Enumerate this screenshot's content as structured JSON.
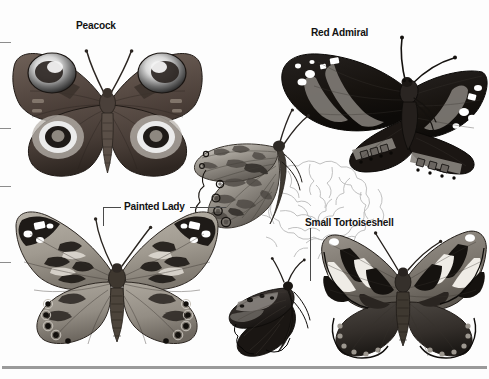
{
  "plate": {
    "title": "Butterfly identification plate",
    "background_color": "#fdfdfd",
    "width": 489,
    "height": 379,
    "style": "grayscale halftone field-guide illustration"
  },
  "labels": [
    {
      "id": "peacock",
      "text": "Peacock",
      "x": 76,
      "y": 19,
      "color": "#121212"
    },
    {
      "id": "red-admiral",
      "text": "Red Admiral",
      "x": 311,
      "y": 26,
      "color": "#121212"
    },
    {
      "id": "painted-lady",
      "text": "Painted Lady",
      "x": 124,
      "y": 200,
      "color": "#121212"
    },
    {
      "id": "small-tortoiseshell",
      "text": "Small Tortoiseshell",
      "x": 305,
      "y": 216,
      "color": "#121212"
    }
  ],
  "leader_lines": [
    {
      "id": "painted-lady-left-horizontal",
      "x": 103,
      "y": 207,
      "w": 18,
      "h": 1
    },
    {
      "id": "painted-lady-left-vertical",
      "x": 103,
      "y": 207,
      "w": 1,
      "h": 19
    },
    {
      "id": "painted-lady-right-horizontal",
      "x": 190,
      "y": 207,
      "w": 36,
      "h": 1
    },
    {
      "id": "small-tortoiseshell-vertical",
      "x": 310,
      "y": 228,
      "w": 1,
      "h": 53
    }
  ],
  "edge_ticks": [
    {
      "id": "tick-top",
      "y": 42,
      "width": 11
    },
    {
      "id": "tick-middle",
      "y": 128,
      "width": 11
    },
    {
      "id": "tick-lower",
      "y": 186,
      "width": 11
    },
    {
      "id": "tick-bottom",
      "y": 262,
      "width": 11
    }
  ],
  "base_rule": {
    "id": "bottom-rule",
    "x": 2,
    "y": 366,
    "w": 485,
    "h": 3,
    "color": "#9a9a9a"
  },
  "specimens": [
    {
      "id": "peacock",
      "common_name": "Peacock",
      "view": "dorsal wings spread",
      "x": 8,
      "y": 33,
      "w": 196,
      "h": 145,
      "features": "four large eyespots, dark red-brown ground colour"
    },
    {
      "id": "red-admiral",
      "common_name": "Red Admiral",
      "view": "dorsal wings spread, angled",
      "x": 258,
      "y": 38,
      "w": 231,
      "h": 145,
      "features": "near-black wings, broad pale bands, white apical spots"
    },
    {
      "id": "peacock-underside",
      "common_name": "Peacock",
      "view": "ventral / underside side view",
      "x": 186,
      "y": 112,
      "w": 122,
      "h": 122,
      "features": "mottled cryptic pattern with ringed ocelli along margin"
    },
    {
      "id": "painted-lady",
      "common_name": "Painted Lady",
      "view": "dorsal wings spread",
      "x": 6,
      "y": 199,
      "w": 220,
      "h": 150,
      "features": "orange ground, black apex with white spots, row of hindwing ocelli"
    },
    {
      "id": "small-tortoiseshell-underside",
      "common_name": "Small Tortoiseshell",
      "view": "ventral side view at rest",
      "x": 228,
      "y": 262,
      "w": 96,
      "h": 100,
      "features": "dark bark-like underside, pale subapical band"
    },
    {
      "id": "small-tortoiseshell",
      "common_name": "Small Tortoiseshell",
      "view": "dorsal wings spread",
      "x": 322,
      "y": 222,
      "w": 167,
      "h": 140,
      "features": "banded forewings with black and cream blocks, blue marginal lunules"
    },
    {
      "id": "background-flower-cluster",
      "common_name": "Flower cluster outline",
      "view": "line drawing background",
      "x": 262,
      "y": 148,
      "w": 132,
      "h": 110,
      "features": "uncoloured outline sketch of a flower head"
    }
  ]
}
